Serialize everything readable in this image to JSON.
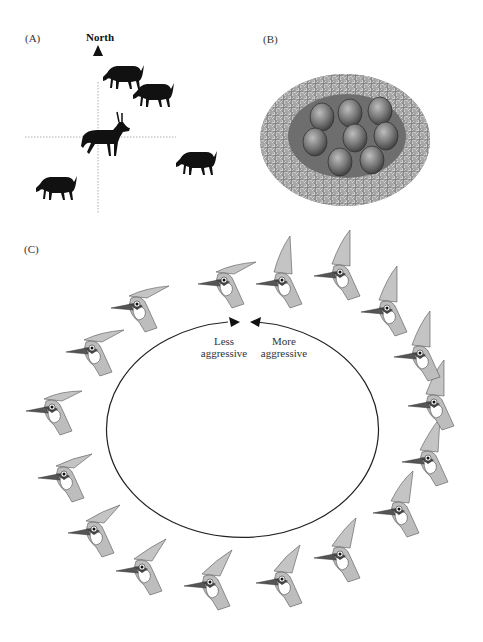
{
  "panels": {
    "a": {
      "label": "(A)",
      "north_label": "North",
      "description": "Deer/antelope herd positions relative to compass axes; one horned male at center",
      "animals": [
        {
          "type": "grazing",
          "x": 125,
          "y": 75
        },
        {
          "type": "grazing",
          "x": 155,
          "y": 93
        },
        {
          "type": "horned-male",
          "x": 105,
          "y": 138
        },
        {
          "type": "grazing",
          "x": 195,
          "y": 162
        },
        {
          "type": "grazing",
          "x": 55,
          "y": 185
        }
      ]
    },
    "b": {
      "label": "(B)",
      "description": "Nest with eight eggs",
      "egg_count": 8
    },
    "c": {
      "label": "(C)",
      "less_label": [
        "Less",
        "aggressive"
      ],
      "more_label": [
        "More",
        "aggressive"
      ],
      "description": "Ring of jay heads showing crest angle from flat (less aggressive) to raised (more aggressive)",
      "bird_count": 20
    }
  },
  "colors": {
    "ink": "#111111",
    "bird_gray": "#b8b8b8",
    "nest": "#9a9a9a",
    "nest_inner": "#6e6e6e",
    "egg": "#7a7a7a"
  }
}
